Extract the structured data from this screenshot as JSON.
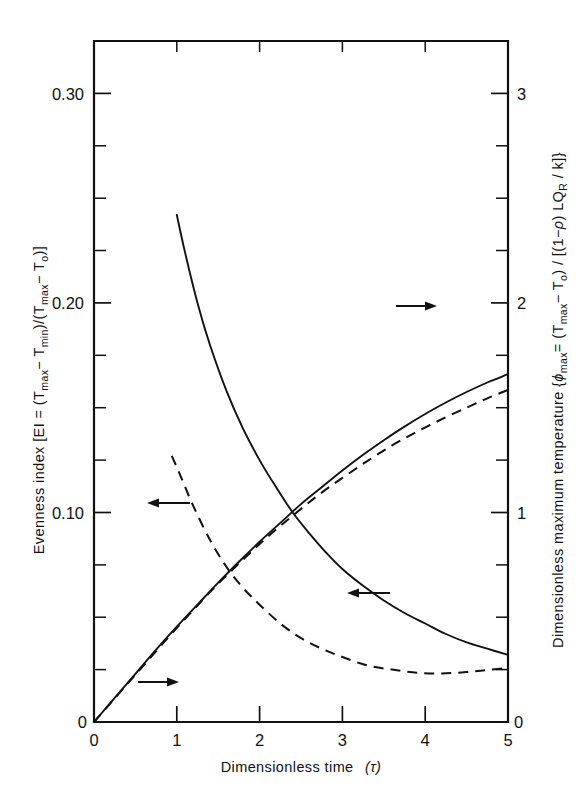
{
  "chart_data": {
    "type": "line",
    "title": "",
    "xlabel": "Dimensionless  time  (τ)",
    "ylabel_left": "Evenness index [EI = (Tₘₐₓ− Tₘᵢₙ)/(Tₘₐₓ− Tₒ)]",
    "ylabel_right": "Dimensionless maximum temperature {ϕₘₐₓ= (Tₘₐₓ− Tₒ) / [(1−ρ) LQʀ / k]}",
    "xlim": [
      0,
      5
    ],
    "ylim_left": [
      0,
      0.325
    ],
    "ylim_right": [
      0,
      3.25
    ],
    "xticks": [
      "0",
      "1",
      "2",
      "3",
      "4",
      "5"
    ],
    "xtick_values": [
      0,
      1,
      2,
      3,
      4,
      5
    ],
    "yticks_left": [
      "0",
      "0.10",
      "0.20",
      "0.30"
    ],
    "ytick_values_left": [
      0,
      0.1,
      0.2,
      0.3
    ],
    "yticks_right": [
      "0",
      "1",
      "2",
      "3"
    ],
    "ytick_values_right": [
      0,
      1,
      2,
      3
    ],
    "minor_ticks_per_major_left": 4,
    "minor_ticks_per_major_right": 4,
    "grid": false,
    "legend": "none",
    "series": [
      {
        "name": "Evenness index (solid, decaying)",
        "style": "solid",
        "axis": "left",
        "x": [
          1.0,
          1.1,
          1.25,
          1.4,
          1.6,
          1.8,
          2.0,
          2.2,
          2.4,
          2.6,
          2.8,
          3.0,
          3.25,
          3.5,
          3.75,
          4.0,
          4.25,
          4.5,
          4.75,
          5.0
        ],
        "y": [
          0.242,
          0.224,
          0.2,
          0.18,
          0.158,
          0.14,
          0.125,
          0.112,
          0.1,
          0.09,
          0.081,
          0.073,
          0.065,
          0.058,
          0.052,
          0.047,
          0.042,
          0.038,
          0.035,
          0.032
        ]
      },
      {
        "name": "Evenness index (dashed, decaying)",
        "style": "dashed",
        "axis": "left",
        "x": [
          0.94,
          1.05,
          1.2,
          1.4,
          1.6,
          1.8,
          2.0,
          2.25,
          2.5,
          2.75,
          3.0,
          3.3,
          3.6,
          3.9,
          4.2,
          4.5,
          4.75,
          5.0
        ],
        "y": [
          0.127,
          0.117,
          0.103,
          0.087,
          0.074,
          0.064,
          0.056,
          0.047,
          0.04,
          0.035,
          0.031,
          0.027,
          0.025,
          0.0235,
          0.0232,
          0.0238,
          0.0248,
          0.0258
        ]
      },
      {
        "name": "Dimensionless maximum temperature (solid, rising)",
        "style": "solid",
        "axis": "right",
        "x": [
          0.0,
          0.25,
          0.5,
          0.75,
          1.0,
          1.25,
          1.5,
          1.75,
          2.0,
          2.25,
          2.5,
          2.75,
          3.0,
          3.25,
          3.5,
          3.75,
          4.0,
          4.25,
          4.5,
          4.75,
          5.0
        ],
        "y": [
          0.0,
          0.115,
          0.23,
          0.345,
          0.455,
          0.56,
          0.665,
          0.765,
          0.86,
          0.95,
          1.04,
          1.12,
          1.2,
          1.275,
          1.345,
          1.41,
          1.47,
          1.525,
          1.575,
          1.62,
          1.66
        ]
      },
      {
        "name": "Dimensionless maximum temperature (dashed, rising)",
        "style": "dashed",
        "axis": "right",
        "x": [
          0.0,
          0.3,
          0.6,
          0.9,
          1.2,
          1.5,
          1.8,
          2.1,
          2.4,
          2.7,
          3.0,
          3.3,
          3.6,
          3.9,
          4.2,
          4.5,
          4.75,
          5.0
        ],
        "y": [
          0.0,
          0.135,
          0.27,
          0.405,
          0.535,
          0.66,
          0.775,
          0.885,
          0.985,
          1.08,
          1.165,
          1.245,
          1.32,
          1.385,
          1.445,
          1.5,
          1.545,
          1.585
        ]
      }
    ],
    "annotations": [
      {
        "name": "arrow-left-upper",
        "direction": "left",
        "x_data": 0.62,
        "y_note": "points to left axis for dashed decay curve"
      },
      {
        "name": "arrow-left-lower",
        "direction": "left",
        "x_data": 3.55,
        "y_note": "points to left axis for solid decay curve"
      },
      {
        "name": "arrow-right-lower",
        "direction": "right",
        "x_data": 0.58,
        "y_note": "points to right axis for rising curves"
      },
      {
        "name": "arrow-right-upper",
        "direction": "right",
        "x_data": 3.85,
        "y_note": "points to right axis for rising curves"
      }
    ]
  },
  "axis_text": {
    "x_title_main": "Dimensionless  time",
    "x_title_paren": "(τ)",
    "left_title_prefix": "Evenness index [EI = (T",
    "left_title_full": "Evenness index [EI = (Tmax− Tmin)/(Tmax− To)]",
    "right_title_full": "Dimensionless maximum temperature {ϕmax= (Tmax− To) / [(1−ρ) LQR / k]}"
  },
  "colors": {
    "ink": "#111111",
    "background": "#ffffff"
  }
}
